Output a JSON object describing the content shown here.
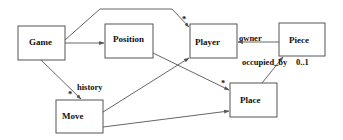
{
  "diagram": {
    "type": "uml-class-diagram",
    "classes": [
      {
        "id": "game",
        "label": "Game",
        "x": 18,
        "y": 26,
        "w": 47,
        "h": 34
      },
      {
        "id": "position",
        "label": "Position",
        "x": 105,
        "y": 24,
        "w": 48,
        "h": 34
      },
      {
        "id": "player",
        "label": "Player",
        "x": 190,
        "y": 24,
        "w": 47,
        "h": 34
      },
      {
        "id": "piece",
        "label": "Piece",
        "x": 279,
        "y": 23,
        "w": 46,
        "h": 33
      },
      {
        "id": "move",
        "label": "Move",
        "x": 56,
        "y": 100,
        "w": 47,
        "h": 33
      },
      {
        "id": "place",
        "label": "Place",
        "x": 230,
        "y": 83,
        "w": 47,
        "h": 34
      }
    ],
    "associations": [
      {
        "from": "game",
        "to": "position",
        "role": "",
        "multiplicity": ""
      },
      {
        "from": "game",
        "to": "player",
        "role": "",
        "multiplicity": "*"
      },
      {
        "from": "game",
        "to": "move",
        "role": "history",
        "multiplicity": "*"
      },
      {
        "from": "position",
        "to": "place",
        "role": "",
        "multiplicity": "*"
      },
      {
        "from": "move",
        "to": "player",
        "role": "",
        "multiplicity": ""
      },
      {
        "from": "move",
        "to": "place",
        "role": "",
        "multiplicity": ""
      },
      {
        "from": "piece",
        "to": "player",
        "role": "owner",
        "multiplicity": ""
      },
      {
        "from": "place",
        "to": "piece",
        "role": "occupied_by",
        "multiplicity": "0..1"
      }
    ],
    "labels": {
      "game_player_mult": "*",
      "history_role": "history",
      "history_mult": "*",
      "position_place_mult": "*",
      "owner_role": "owner",
      "occupied_role": "occupied_by",
      "occupied_mult": "0..1"
    }
  }
}
